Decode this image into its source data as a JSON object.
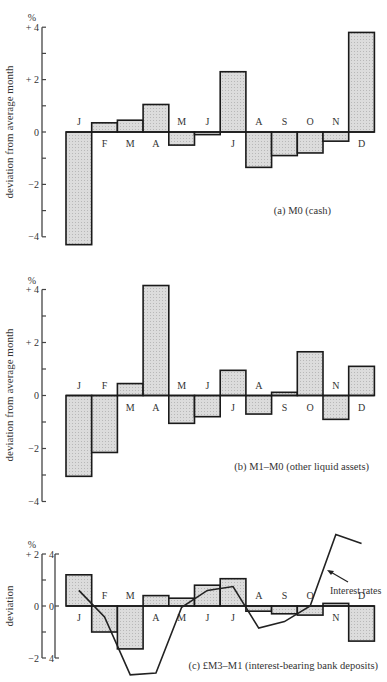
{
  "chart_data": [
    {
      "type": "bar",
      "panel": "a",
      "title": "(a)  M0 (cash)",
      "ylabel": "deviation from average month",
      "unit": "%",
      "ylim": [
        -4,
        4
      ],
      "yticks": [
        4,
        3,
        2,
        1,
        0,
        -1,
        -2,
        -3,
        -4
      ],
      "ytick_labels": {
        "4": "+ 4",
        "2": "+ 2",
        "0": "0",
        "-2": "−2",
        "-4": "−4"
      },
      "categories": [
        "J",
        "F",
        "M",
        "A",
        "M",
        "J",
        "J",
        "A",
        "S",
        "O",
        "N",
        "D"
      ],
      "values": [
        -4.3,
        0.35,
        0.45,
        1.05,
        -0.5,
        -0.1,
        2.3,
        -1.35,
        -0.9,
        -0.8,
        -0.35,
        3.8
      ]
    },
    {
      "type": "bar",
      "panel": "b",
      "title": "(b)  M1–M0 (other liquid assets)",
      "ylabel": "deviation from average month",
      "unit": "%",
      "ylim": [
        -4,
        4
      ],
      "yticks": [
        4,
        3,
        2,
        1,
        0,
        -1,
        -2,
        -3,
        -4
      ],
      "ytick_labels": {
        "4": "+ 4",
        "2": "+ 2",
        "0": "0",
        "-2": "−2",
        "-4": "−4"
      },
      "categories": [
        "J",
        "F",
        "M",
        "A",
        "M",
        "J",
        "J",
        "A",
        "S",
        "O",
        "N",
        "D"
      ],
      "values": [
        -3.05,
        -2.15,
        0.45,
        4.15,
        -1.05,
        -0.8,
        0.95,
        -0.7,
        0.12,
        1.65,
        -0.9,
        1.1
      ]
    },
    {
      "type": "bar",
      "panel": "c",
      "title": "(c)  £M3–M1 (interest-bearing bank deposits)",
      "ylabel": "deviation",
      "unit": "%",
      "ylim": [
        -2,
        2
      ],
      "yticks": [
        2,
        1,
        0,
        -1,
        -2
      ],
      "ytick_labels": {
        "2": "+ 2",
        "0": "0",
        "-2": "−2"
      },
      "secondary_axis": {
        "ylim": [
          -4,
          4
        ],
        "tick_labels": [
          "4",
          "0",
          "4"
        ]
      },
      "categories": [
        "J",
        "F",
        "M",
        "A",
        "M",
        "J",
        "J",
        "A",
        "S",
        "O",
        "N",
        "D"
      ],
      "values": [
        1.2,
        -1.0,
        -1.65,
        0.4,
        0.3,
        0.8,
        1.05,
        -0.2,
        -0.3,
        -0.35,
        0.1,
        -1.35
      ],
      "series": [
        {
          "name": "deposits",
          "type": "bar",
          "values": [
            1.2,
            -1.0,
            -1.65,
            0.4,
            0.3,
            0.8,
            1.05,
            -0.2,
            -0.3,
            -0.35,
            0.1,
            -1.35
          ]
        },
        {
          "name": "Interest rates",
          "type": "line",
          "axis": "secondary",
          "values": [
            1.2,
            -0.85,
            -5.3,
            -5.15,
            -0.1,
            1.2,
            1.5,
            -1.7,
            -1.2,
            0.0,
            5.5,
            4.8
          ]
        }
      ],
      "annotation": "Interest rates"
    }
  ]
}
